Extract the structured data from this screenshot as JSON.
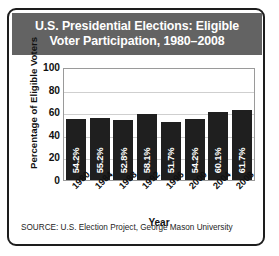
{
  "figure": {
    "title_line1": "U.S. Presidential Elections: Eligible",
    "title_line2": "Voter Participation, 1980–2008",
    "source": "SOURCE: U.S. Election Project, George Mason University",
    "colors": {
      "banner_background": "#636363",
      "banner_text": "#ffffff",
      "bar_fill": "#1f1f1f",
      "bar_label_text": "#ffffff",
      "frame_border": "#1d1d1d",
      "plot_border": "#9a9a9a",
      "gridline": "#cfcfcf",
      "page_background": "#ffffff"
    }
  },
  "chart_data": {
    "type": "bar",
    "title": "U.S. Presidential Elections: Eligible Voter Participation, 1980–2008",
    "xlabel": "Year",
    "ylabel": "Percentage of Eligible Voters",
    "categories": [
      "1980",
      "1984",
      "1988",
      "1992",
      "1996",
      "2000",
      "2004",
      "2008"
    ],
    "values": [
      54.2,
      55.2,
      52.8,
      58.1,
      51.7,
      54.2,
      60.1,
      61.7
    ],
    "value_labels": [
      "54.2%",
      "55.2%",
      "52.8%",
      "58.1%",
      "51.7%",
      "54.2%",
      "60.1%",
      "61.7%"
    ],
    "ylim": [
      0,
      100
    ],
    "yticks": [
      100,
      80,
      60,
      40,
      20,
      0
    ],
    "ytick_labels": [
      "100",
      "80",
      "60",
      "40",
      "20",
      "0"
    ],
    "grid": true,
    "legend": "none",
    "source": "SOURCE: U.S. Election Project, George Mason University"
  }
}
